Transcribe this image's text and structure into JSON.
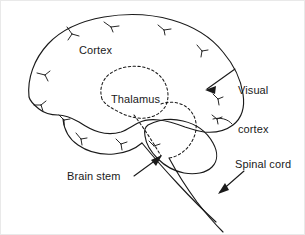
{
  "figure": {
    "kind": "anatomical-line-diagram",
    "background_color": "#ffffff",
    "line_color": "#1a1a1a",
    "border_color": "#e9e9e9"
  },
  "labels": {
    "cortex": "Cortex",
    "thalamus": "Thalamus",
    "visual_cortex_line1": "Visual",
    "visual_cortex_line2": "cortex",
    "brain_stem": "Brain stem",
    "spinal_cord": "Spinal cord"
  },
  "structures": [
    {
      "name": "cortex",
      "label": "Cortex",
      "style": "solid-outline",
      "note": "large cerebral hemisphere outline with small branching sulci marks"
    },
    {
      "name": "thalamus",
      "label": "Thalamus",
      "style": "dashed-outline",
      "note": "hidden internal structure drawn with dashed contour"
    },
    {
      "name": "visual-cortex",
      "label": "Visual cortex",
      "style": "arrow-callout",
      "note": "arrow points left into the rear (occipital) pole of the cortex"
    },
    {
      "name": "cerebellum",
      "label": "",
      "style": "solid-outline",
      "note": "rounded lobed mass below and behind the cortex, unlabeled"
    },
    {
      "name": "brain-stem",
      "label": "Brain stem",
      "style": "arrow-callout",
      "note": "arrow points up-right to the stem below the cerebellum"
    },
    {
      "name": "spinal-cord",
      "label": "Spinal cord",
      "style": "arrow-callout",
      "note": "arrow points down-left onto the paired lines descending from the brain stem"
    }
  ],
  "callouts": [
    {
      "name": "visual-cortex",
      "arrow_direction": "left",
      "tip": [
        206,
        88
      ]
    },
    {
      "name": "brain-stem",
      "arrow_direction": "up-right",
      "tip": [
        159,
        155
      ]
    },
    {
      "name": "spinal-cord",
      "arrow_direction": "down-left",
      "tip": [
        218,
        192
      ]
    }
  ]
}
